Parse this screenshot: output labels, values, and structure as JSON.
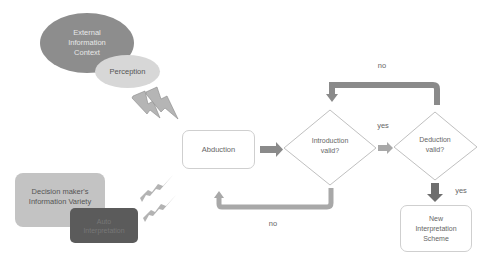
{
  "diagram": {
    "nodes": {
      "external_context": {
        "label_lines": [
          "External",
          "Information",
          "Context"
        ],
        "shape": "ellipse",
        "color": "#8c8c8c"
      },
      "perception": {
        "label": "Perception",
        "shape": "ellipse",
        "color": "#d6d6d6"
      },
      "decision_maker": {
        "label_lines": [
          "Decision maker's",
          "Information Variety"
        ],
        "shape": "rounded-rect",
        "color": "#c2c2c2"
      },
      "auto_interpretation": {
        "label_lines": [
          "Auto",
          "Interpretation"
        ],
        "shape": "rounded-rect",
        "color": "#5a5a5a"
      },
      "abduction": {
        "label": "Abduction",
        "shape": "rounded-rect",
        "color": "#ffffff"
      },
      "introduction_valid": {
        "label_lines": [
          "Introduction",
          "valid?"
        ],
        "shape": "diamond"
      },
      "deduction_valid": {
        "label_lines": [
          "Deduction",
          "valid?"
        ],
        "shape": "diamond"
      },
      "new_scheme": {
        "label_lines": [
          "New",
          "Interpretation",
          "Scheme"
        ],
        "shape": "rounded-rect"
      }
    },
    "edges": {
      "intro_yes": "yes",
      "intro_no": "no",
      "deduction_yes": "yes",
      "deduction_no": "no"
    },
    "colors": {
      "arrow_fill": "#8a8a8a",
      "node_border": "#c8c8c8",
      "lightning": "#a8a8a8"
    }
  }
}
